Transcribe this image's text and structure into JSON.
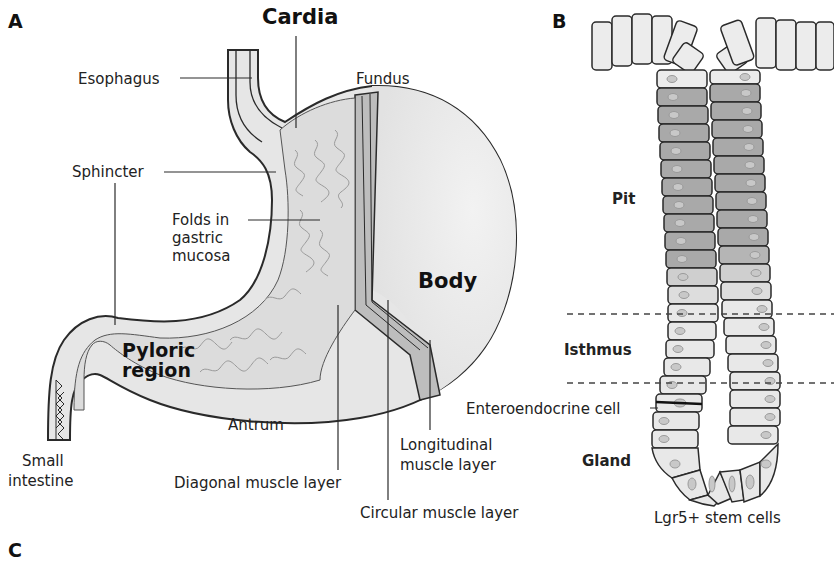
{
  "panels": {
    "a": "A",
    "b": "B",
    "c": "C"
  },
  "stomach": {
    "labels": {
      "cardia": "Cardia",
      "esophagus": "Esophagus",
      "fundus": "Fundus",
      "sphincter": "Sphincter",
      "folds_line1": "Folds in",
      "folds_line2": "gastric",
      "folds_line3": "mucosa",
      "body": "Body",
      "pyloric_line1": "Pyloric",
      "pyloric_line2": "region",
      "antrum": "Antrum",
      "small_intestine_line1": "Small",
      "small_intestine_line2": "intestine",
      "diagonal_muscle": "Diagonal muscle layer",
      "longitudinal_line1": "Longitudinal",
      "longitudinal_line2": "muscle layer",
      "circular_muscle": "Circular muscle layer"
    }
  },
  "gland": {
    "labels": {
      "pit": "Pit",
      "isthmus": "Isthmus",
      "enteroendocrine": "Enteroendocrine cell",
      "gland": "Gland",
      "stem_cells": "Lgr5+ stem cells"
    }
  },
  "colors": {
    "outline": "#2a2a2a",
    "pale_fill": "#ececec",
    "pit_cell_fill": "#a9a9a9",
    "mucosa_fill": "#d9d9d9",
    "muscle_fill": "#bdbdbd",
    "dashed_line": "#444444"
  }
}
